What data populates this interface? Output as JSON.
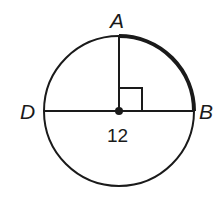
{
  "diagram": {
    "type": "circle-geometry",
    "colors": {
      "stroke": "#1a1a1a",
      "background": "#ffffff"
    },
    "circle": {
      "cx": 119,
      "cy": 111,
      "r": 75
    },
    "points": {
      "A": {
        "label": "A"
      },
      "B": {
        "label": "B"
      },
      "D": {
        "label": "D"
      }
    },
    "segments": [
      "DB (diameter)",
      "center-A (radius)"
    ],
    "right_angle_marker": true,
    "highlighted_arc": "AB",
    "measure_label": "12"
  }
}
